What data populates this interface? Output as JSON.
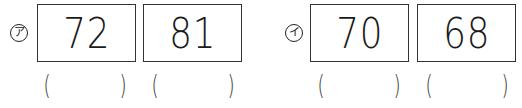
{
  "groups": [
    {
      "label": "ア",
      "boxes": [
        {
          "value": "72",
          "answer": ""
        },
        {
          "value": "81",
          "answer": ""
        }
      ]
    },
    {
      "label": "イ",
      "boxes": [
        {
          "value": "70",
          "answer": ""
        },
        {
          "value": "68",
          "answer": ""
        }
      ]
    }
  ],
  "paren_open": "(",
  "paren_close": ")"
}
